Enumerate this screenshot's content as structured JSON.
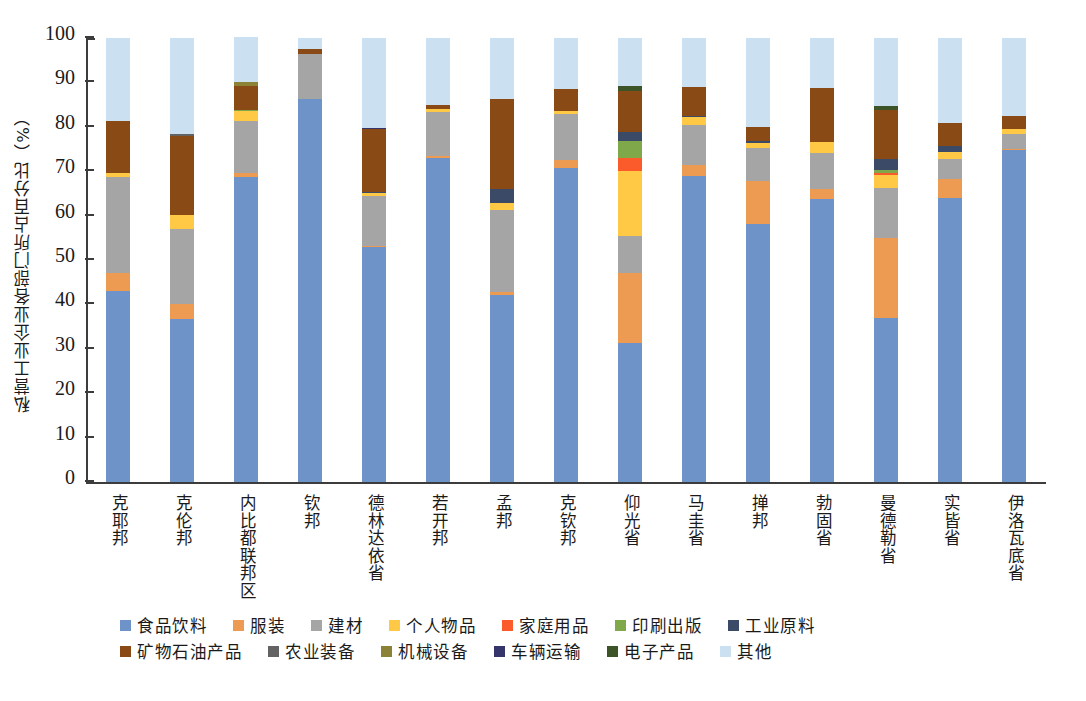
{
  "chart_data": {
    "type": "bar",
    "subtype": "stacked-100-percent",
    "title": "",
    "xlabel": "",
    "ylabel": "私营工业企业各部门所占百分比（%）",
    "ylim": [
      0,
      100
    ],
    "ytick_labels": [
      "0",
      "10",
      "20",
      "30",
      "40",
      "50",
      "60",
      "70",
      "80",
      "90",
      "100"
    ],
    "ytick_values": [
      0,
      10,
      20,
      30,
      40,
      50,
      60,
      70,
      80,
      90,
      100
    ],
    "grid": false,
    "legend_position": "bottom",
    "categories": [
      "克耶邦",
      "克伦邦",
      "内比都联邦区",
      "钦邦",
      "德林达依省",
      "若开邦",
      "孟邦",
      "克钦邦",
      "仰光省",
      "马圭省",
      "掸邦",
      "勃固省",
      "曼德勒省",
      "实皆省",
      "伊洛瓦底省"
    ],
    "series": [
      {
        "name": "食品饮料",
        "color": "#6e93c8",
        "values": [
          43.0,
          36.8,
          68.7,
          86.2,
          52.9,
          73.0,
          42.2,
          70.8,
          31.4,
          69.0,
          58.2,
          63.8,
          36.9,
          63.9,
          74.8
        ]
      },
      {
        "name": "服装",
        "color": "#ed9b52",
        "values": [
          4.0,
          3.4,
          0.9,
          0.0,
          0.3,
          0.4,
          0.6,
          1.8,
          15.6,
          2.5,
          9.6,
          2.3,
          18.0,
          4.4,
          0.3
        ]
      },
      {
        "name": "建材",
        "color": "#a5a5a5",
        "values": [
          21.8,
          16.8,
          11.8,
          10.3,
          11.3,
          9.9,
          18.5,
          10.3,
          8.5,
          8.9,
          7.5,
          7.9,
          11.3,
          4.4,
          3.2
        ]
      },
      {
        "name": "个人物品",
        "color": "#ffc945",
        "values": [
          0.8,
          3.2,
          2.1,
          0.0,
          0.5,
          0.8,
          1.6,
          0.6,
          14.6,
          1.7,
          1.0,
          2.6,
          3.0,
          1.6,
          1.1
        ]
      },
      {
        "name": "家庭用品",
        "color": "#fb5a2a",
        "values": [
          0.0,
          0.0,
          0.0,
          0.0,
          0.0,
          0.0,
          0.0,
          0.0,
          2.9,
          0.0,
          0.0,
          0.0,
          0.5,
          0.0,
          0.0
        ]
      },
      {
        "name": "印刷出版",
        "color": "#7fa84b",
        "values": [
          0.0,
          0.0,
          0.3,
          0.0,
          0.0,
          0.0,
          0.0,
          0.0,
          3.9,
          0.0,
          0.0,
          0.0,
          0.6,
          0.0,
          0.0
        ]
      },
      {
        "name": "工业原料",
        "color": "#3b4a66",
        "values": [
          0.0,
          0.0,
          0.0,
          0.0,
          0.3,
          0.0,
          3.1,
          0.0,
          2.0,
          0.4,
          0.4,
          0.0,
          2.4,
          1.4,
          0.0
        ]
      },
      {
        "name": "矿物石油产品",
        "color": "#8a4a16",
        "values": [
          11.8,
          17.8,
          5.4,
          1.1,
          14.1,
          0.9,
          20.3,
          5.0,
          9.2,
          6.5,
          3.3,
          12.1,
          11.0,
          5.1,
          3.0
        ]
      },
      {
        "name": "农业装备",
        "color": "#636363",
        "values": [
          0.0,
          0.4,
          0.0,
          0.0,
          0.0,
          0.0,
          0.0,
          0.0,
          0.0,
          0.0,
          0.0,
          0.0,
          0.0,
          0.0,
          0.0
        ]
      },
      {
        "name": "机械设备",
        "color": "#8b8236",
        "values": [
          0.0,
          0.0,
          0.9,
          0.0,
          0.0,
          0.0,
          0.0,
          0.0,
          0.0,
          0.0,
          0.0,
          0.0,
          0.0,
          0.0,
          0.0
        ]
      },
      {
        "name": "车辆运输",
        "color": "#35356b",
        "values": [
          0.0,
          0.0,
          0.0,
          0.0,
          0.3,
          0.0,
          0.0,
          0.0,
          0.0,
          0.0,
          0.0,
          0.0,
          0.0,
          0.0,
          0.0
        ]
      },
      {
        "name": "电子产品",
        "color": "#3c5428",
        "values": [
          0.0,
          0.0,
          0.0,
          0.0,
          0.0,
          0.0,
          0.0,
          0.0,
          1.1,
          0.0,
          0.0,
          0.0,
          0.9,
          0.0,
          0.0
        ]
      },
      {
        "name": "其他",
        "color": "#cbe0f0",
        "values": [
          18.6,
          21.6,
          10.1,
          2.4,
          20.3,
          15.0,
          13.7,
          11.5,
          10.8,
          11.0,
          20.0,
          11.3,
          15.4,
          19.2,
          17.6
        ]
      }
    ]
  },
  "legend": {
    "row1": [
      "食品饮料",
      "服装",
      "建材",
      "个人物品",
      "家庭用品",
      "印刷出版",
      "工业原料"
    ],
    "row2": [
      "矿物石油产品",
      "农业装备",
      "机械设备",
      "车辆运输",
      "电子产品",
      "其他"
    ]
  }
}
